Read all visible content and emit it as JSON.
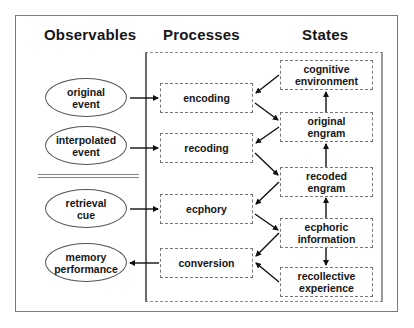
{
  "headings": {
    "observables": "Observables",
    "processes": "Processes",
    "states": "States"
  },
  "observables": [
    {
      "id": "original-event",
      "label": "original\nevent"
    },
    {
      "id": "interpolated-event",
      "label": "interpolated\nevent"
    },
    {
      "id": "retrieval-cue",
      "label": "retrieval\ncue"
    },
    {
      "id": "memory-performance",
      "label": "memory\nperformance"
    }
  ],
  "processes": [
    {
      "id": "encoding",
      "label": "encoding"
    },
    {
      "id": "recoding",
      "label": "recoding"
    },
    {
      "id": "ecphory",
      "label": "ecphory"
    },
    {
      "id": "conversion",
      "label": "conversion"
    }
  ],
  "states": [
    {
      "id": "cognitive-environment",
      "label": "cognitive\nenvironment"
    },
    {
      "id": "original-engram",
      "label": "original\nengram"
    },
    {
      "id": "recoded-engram",
      "label": "recoded\nengram"
    },
    {
      "id": "ecphoric-information",
      "label": "ecphoric\ninformation"
    },
    {
      "id": "recollective-experience",
      "label": "recollective\nexperience"
    }
  ],
  "edges": [
    {
      "from": "original event",
      "to": "encoding"
    },
    {
      "from": "interpolated event",
      "to": "recoding"
    },
    {
      "from": "retrieval cue",
      "to": "ecphory"
    },
    {
      "from": "conversion",
      "to": "memory performance"
    },
    {
      "from": "cognitive environment",
      "to": "encoding"
    },
    {
      "from": "encoding",
      "to": "original engram"
    },
    {
      "from": "original engram",
      "to": "recoding"
    },
    {
      "from": "recoding",
      "to": "recoded engram"
    },
    {
      "from": "recoded engram",
      "to": "ecphory"
    },
    {
      "from": "ecphory",
      "to": "ecphoric information"
    },
    {
      "from": "ecphoric information",
      "to": "conversion"
    },
    {
      "from": "recollective experience",
      "to": "conversion"
    },
    {
      "from": "original engram",
      "to": "cognitive environment"
    },
    {
      "from": "recoded engram",
      "to": "original engram"
    },
    {
      "from": "ecphoric information",
      "to": "recoded engram"
    },
    {
      "from": "ecphoric information",
      "to": "recollective experience"
    }
  ]
}
